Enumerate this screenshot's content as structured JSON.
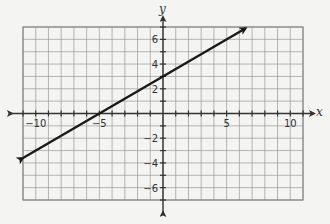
{
  "chart_data": {
    "type": "line",
    "title": "",
    "xlabel": "x",
    "ylabel": "y",
    "xlim": [
      -11,
      11
    ],
    "ylim": [
      -7,
      7
    ],
    "grid": true,
    "x_ticks": [
      -10,
      -5,
      5,
      10
    ],
    "x_tick_labels": [
      "−10",
      "−5",
      "5",
      "10"
    ],
    "y_ticks": [
      -6,
      -4,
      -2,
      2,
      4,
      6
    ],
    "y_tick_labels": [
      "−6",
      "−4",
      "−2",
      "2",
      "4",
      "6"
    ],
    "series": [
      {
        "name": "line",
        "equation": "y = 0.6x + 3",
        "slope": 0.6,
        "intercept": 3,
        "x": [
          -11,
          -5,
          0,
          5,
          6.5
        ],
        "y": [
          -3.6,
          0,
          3,
          6,
          6.9
        ],
        "arrows": "both",
        "color": "#1a1a1a"
      }
    ],
    "legend": null
  },
  "colors": {
    "background": "#f4f4f2",
    "grid": "#9a9a9a",
    "axis": "#333333",
    "line": "#1a1a1a"
  }
}
